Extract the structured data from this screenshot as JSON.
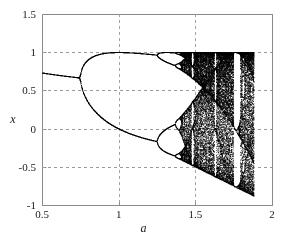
{
  "chart_data": {
    "type": "scatter",
    "title": "",
    "subtitle": "",
    "xlabel": "a",
    "ylabel": "x",
    "xlim": [
      0.5,
      2.0
    ],
    "ylim": [
      -1.0,
      1.5
    ],
    "xticks": [
      "0.5",
      "1",
      "1.5",
      "2"
    ],
    "xtick_values": [
      0.5,
      1.0,
      1.5,
      2.0
    ],
    "yticks": [
      "1.5",
      "1",
      "0.5",
      "0",
      "-0.5",
      "-1"
    ],
    "ytick_values": [
      1.5,
      1.0,
      0.5,
      0.0,
      -0.5,
      -1.0
    ],
    "grid": true,
    "grid_style": "dashed",
    "grid_color": "#9a9a9a",
    "legend": "none",
    "point_color": "#000000",
    "axis_color": "#8a8a8a",
    "background": "#ffffff",
    "map_equation": "x_{n+1} = 1 - a * x_n^2",
    "x_start": 0.5,
    "x_end": 1.88,
    "x_step": 0.0025,
    "transient_iterations": 300,
    "plotted_iterations": 140,
    "seed_x": 0.1,
    "bifurcation_points": [
      {
        "a": 0.75,
        "period_from": 1,
        "period_to": 2
      },
      {
        "a": 1.25,
        "period_from": 2,
        "period_to": 4
      },
      {
        "a": 1.368,
        "period_from": 4,
        "period_to": 8
      },
      {
        "a": 1.401,
        "period_from": 8,
        "period_to": "chaos"
      }
    ],
    "annotations": []
  },
  "axes": {
    "x_title": "a",
    "y_title": "x"
  }
}
